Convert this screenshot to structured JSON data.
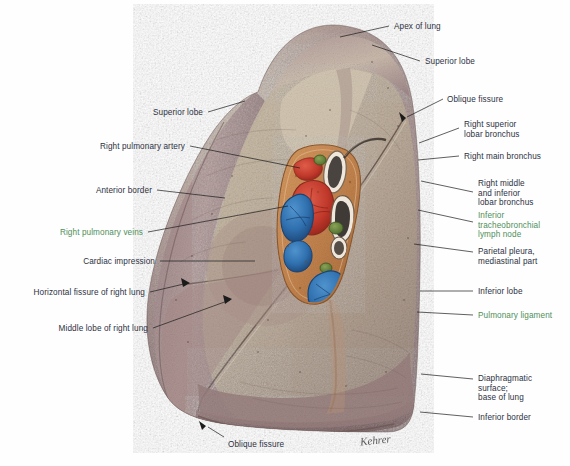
{
  "figure": {
    "signature": "Kehrer"
  },
  "palette": {
    "label_color": "#2d3142",
    "label_highlight_color": "#4f8f5a",
    "leader_line_color": "#1b1b1b",
    "artery_red": "#c0392b",
    "vein_blue": "#2f6fae",
    "bronchus_white": "#efe7dc",
    "lymph_green": "#5c7a35",
    "hilum_tan": "#c98a53",
    "lung_mauve": "#a2868a",
    "lung_pale": "#cdbfae",
    "background": "#fefefe"
  },
  "labels": [
    {
      "id": "apex-of-lung",
      "text": "Apex of lung",
      "x": 394,
      "y": 22,
      "align": "left",
      "green": false
    },
    {
      "id": "superior-lobe-right",
      "text": "Superior lobe",
      "x": 425,
      "y": 57,
      "align": "left",
      "green": false
    },
    {
      "id": "oblique-fissure-top",
      "text": "Oblique fissure",
      "x": 447,
      "y": 95,
      "align": "left",
      "green": false
    },
    {
      "id": "right-superior-lobar-bronchus",
      "text": "Right superior\nlobar bronchus",
      "x": 464,
      "y": 120,
      "align": "left",
      "green": false
    },
    {
      "id": "right-main-bronchus",
      "text": "Right main bronchus",
      "x": 464,
      "y": 152,
      "align": "left",
      "green": false
    },
    {
      "id": "right-middle-and-inferior-lobar-bronchus",
      "text": "Right middle\nand inferior\nlobar bronchus",
      "x": 478,
      "y": 179,
      "align": "left",
      "green": false
    },
    {
      "id": "inferior-tracheobronchial-lymph-node",
      "text": "Inferior\ntracheobronchial\nlymph node",
      "x": 478,
      "y": 211,
      "align": "left",
      "green": true
    },
    {
      "id": "parietal-pleura-mediastinal-part",
      "text": "Parietal pleura,\nmediastinal part",
      "x": 478,
      "y": 247,
      "align": "left",
      "green": false
    },
    {
      "id": "inferior-lobe-right",
      "text": "Inferior lobe",
      "x": 478,
      "y": 287,
      "align": "left",
      "green": false
    },
    {
      "id": "pulmonary-ligament",
      "text": "Pulmonary ligament",
      "x": 478,
      "y": 311,
      "align": "left",
      "green": true
    },
    {
      "id": "diaphragmatic-surface",
      "text": "Diaphragmatic\nsurface;\nbase of lung",
      "x": 478,
      "y": 374,
      "align": "left",
      "green": false
    },
    {
      "id": "inferior-border",
      "text": "Inferior border",
      "x": 478,
      "y": 413,
      "align": "left",
      "green": false
    },
    {
      "id": "superior-lobe-left",
      "text": "Superior lobe",
      "x": 203,
      "y": 108,
      "align": "right",
      "green": false
    },
    {
      "id": "right-pulmonary-artery",
      "text": "Right pulmonary artery",
      "x": 185,
      "y": 142,
      "align": "right",
      "green": false
    },
    {
      "id": "anterior-border",
      "text": "Anterior border",
      "x": 152,
      "y": 186,
      "align": "right",
      "green": false
    },
    {
      "id": "right-pulmonary-veins",
      "text": "Right pulmonary veins",
      "x": 143,
      "y": 228,
      "align": "right",
      "green": true
    },
    {
      "id": "cardiac-impression",
      "text": "Cardiac impression",
      "x": 155,
      "y": 257,
      "align": "right",
      "green": false
    },
    {
      "id": "horizontal-fissure-of-right-lung",
      "text": "Horizontal fissure of right lung",
      "x": 145,
      "y": 288,
      "align": "right",
      "green": false
    },
    {
      "id": "middle-lobe-of-right-lung",
      "text": "Middle lobe of right lung",
      "x": 148,
      "y": 324,
      "align": "right",
      "green": false
    },
    {
      "id": "oblique-fissure-bottom",
      "text": "Oblique fissure",
      "x": 228,
      "y": 440,
      "align": "left",
      "green": false
    }
  ],
  "leader_lines": [
    {
      "id": "leader-apex-of-lung",
      "points": "389,26 340,37"
    },
    {
      "id": "leader-superior-lobe-right",
      "points": "420,61 372,45"
    },
    {
      "id": "leader-oblique-fissure-top",
      "points": "443,99 407,117"
    },
    {
      "id": "leader-right-superior-lobar-bronchus",
      "points": "459,128 419,143"
    },
    {
      "id": "leader-right-main-bronchus",
      "points": "459,156 418,160"
    },
    {
      "id": "leader-right-middle-inferior-bronchus",
      "points": "473,192 421,181"
    },
    {
      "id": "leader-inferior-tracheobronchial-lymph-node",
      "points": "473,222 418,210"
    },
    {
      "id": "leader-parietal-pleura",
      "points": "473,252 414,244"
    },
    {
      "id": "leader-inferior-lobe-right",
      "points": "473,291 420,291"
    },
    {
      "id": "leader-pulmonary-ligament",
      "points": "473,315 417,312"
    },
    {
      "id": "leader-diaphragmatic-surface",
      "points": "473,379 421,374"
    },
    {
      "id": "leader-inferior-border",
      "points": "473,417 420,412"
    },
    {
      "id": "leader-superior-lobe-left",
      "points": "208,112 245,101"
    },
    {
      "id": "leader-right-pulmonary-artery",
      "points": "190,146 300,168"
    },
    {
      "id": "leader-anterior-border",
      "points": "157,190 225,198"
    },
    {
      "id": "leader-right-pulmonary-veins",
      "points": "148,232 288,206"
    },
    {
      "id": "leader-cardiac-impression",
      "points": "160,261 255,261"
    },
    {
      "id": "leader-horizontal-fissure",
      "points": "150,292 188,283"
    },
    {
      "id": "leader-middle-lobe",
      "points": "153,328 230,300"
    },
    {
      "id": "leader-oblique-fissure-bottom",
      "points": "224,437 208,427"
    }
  ],
  "hilum_structures": [
    {
      "id": "right-superior-lobar-bronchus-shape",
      "kind": "bronchus",
      "color": "#efe7dc"
    },
    {
      "id": "right-pulmonary-artery-shape",
      "kind": "artery",
      "color": "#c0392b"
    },
    {
      "id": "right-main-bronchus-shape",
      "kind": "bronchus",
      "color": "#3a3430"
    },
    {
      "id": "superior-pulmonary-vein-shape",
      "kind": "vein",
      "color": "#2f6fae"
    },
    {
      "id": "inferior-pulmonary-vein-shape",
      "kind": "vein",
      "color": "#2f6fae"
    },
    {
      "id": "inferior-tracheobronchial-lymph-node-shape",
      "kind": "lymph-node",
      "color": "#5c7a35"
    }
  ]
}
